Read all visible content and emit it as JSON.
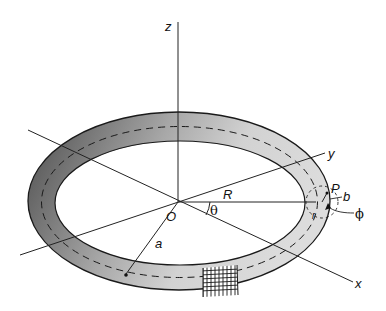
{
  "figure": {
    "colors": {
      "torus_dark": "#555555",
      "torus_light": "#d4d4d4",
      "outline": "#1a1a1a",
      "axes": "#222222"
    }
  },
  "labels": {
    "z": "z",
    "y": "y",
    "x": "x",
    "origin": "O",
    "R": "R",
    "theta": "θ",
    "a": "a",
    "P": "P",
    "b": "b",
    "r": "r",
    "phi": "ϕ"
  }
}
